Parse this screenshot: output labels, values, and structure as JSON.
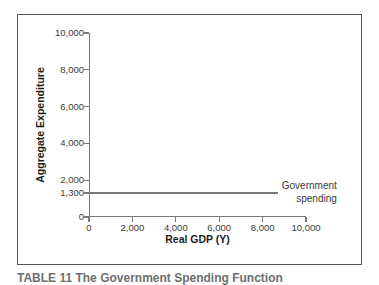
{
  "figure": {
    "caption": "TABLE 11 The Government Spending Function"
  },
  "chart_data": {
    "type": "line",
    "title": "",
    "xlabel": "Real GDP (Y)",
    "ylabel": "Aggregate Expenditure",
    "xlim": [
      0,
      10000
    ],
    "ylim": [
      0,
      10000
    ],
    "grid": false,
    "legend_position": "right-inline-annotation",
    "x_ticks": [
      0,
      2000,
      4000,
      6000,
      8000,
      10000
    ],
    "x_tick_labels": [
      "0",
      "2,000",
      "4,000",
      "6,000",
      "8,000",
      "10,000"
    ],
    "y_ticks": [
      0,
      1300,
      2000,
      4000,
      6000,
      8000,
      10000
    ],
    "y_tick_labels": [
      "0",
      "1,300",
      "2,000",
      "4,000",
      "6,000",
      "8,000",
      "10,000"
    ],
    "series": [
      {
        "name": "Government spending",
        "annotation": [
          "Government",
          "spending"
        ],
        "constant_value": 1300,
        "x": [
          0,
          8700
        ],
        "values": [
          1300,
          1300
        ],
        "color": "#7a7a7a"
      }
    ]
  },
  "colors": {
    "line": "#7a7a7a",
    "axis": "#7a7a7a",
    "frame": "#555555",
    "text": "#3a3a3a",
    "title_text": "#1c1c1c",
    "background": "#ffffff"
  }
}
